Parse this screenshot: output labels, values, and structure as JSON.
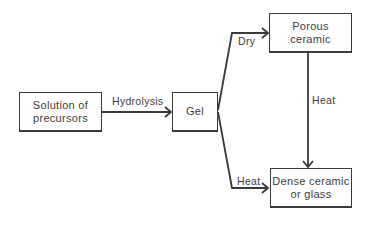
{
  "diagram": {
    "nodes": [
      {
        "id": "solution",
        "label": "Solution of\nprecursors",
        "line1": "Solution of",
        "line2": "precursors"
      },
      {
        "id": "gel",
        "label": "Gel"
      },
      {
        "id": "porous",
        "label": "Porous\nceramic",
        "line1": "Porous",
        "line2": "ceramic"
      },
      {
        "id": "dense",
        "label": "Dense ceramic\nor glass",
        "line1": "Dense ceramic",
        "line2": "or glass"
      }
    ],
    "edges": [
      {
        "from": "solution",
        "to": "gel",
        "label": "Hydrolysis"
      },
      {
        "from": "gel",
        "to": "porous",
        "label": "Dry"
      },
      {
        "from": "gel",
        "to": "dense",
        "label": "Heat"
      },
      {
        "from": "porous",
        "to": "dense",
        "label": "Heat"
      }
    ]
  },
  "colors": {
    "stroke": "#3a3a3a",
    "text": "#3d3d3d",
    "background": "#ffffff"
  }
}
